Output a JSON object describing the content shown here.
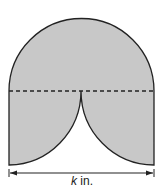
{
  "figure": {
    "fill_color": "#c8c8c8",
    "stroke_color": "#222222",
    "width_label_var": "k",
    "width_label_unit": " in.",
    "parts": [
      "semicircle-top",
      "rectangle-bottom-with-two-quarter-circle-cutouts",
      "dashed-divider",
      "dimension-arrow"
    ]
  }
}
